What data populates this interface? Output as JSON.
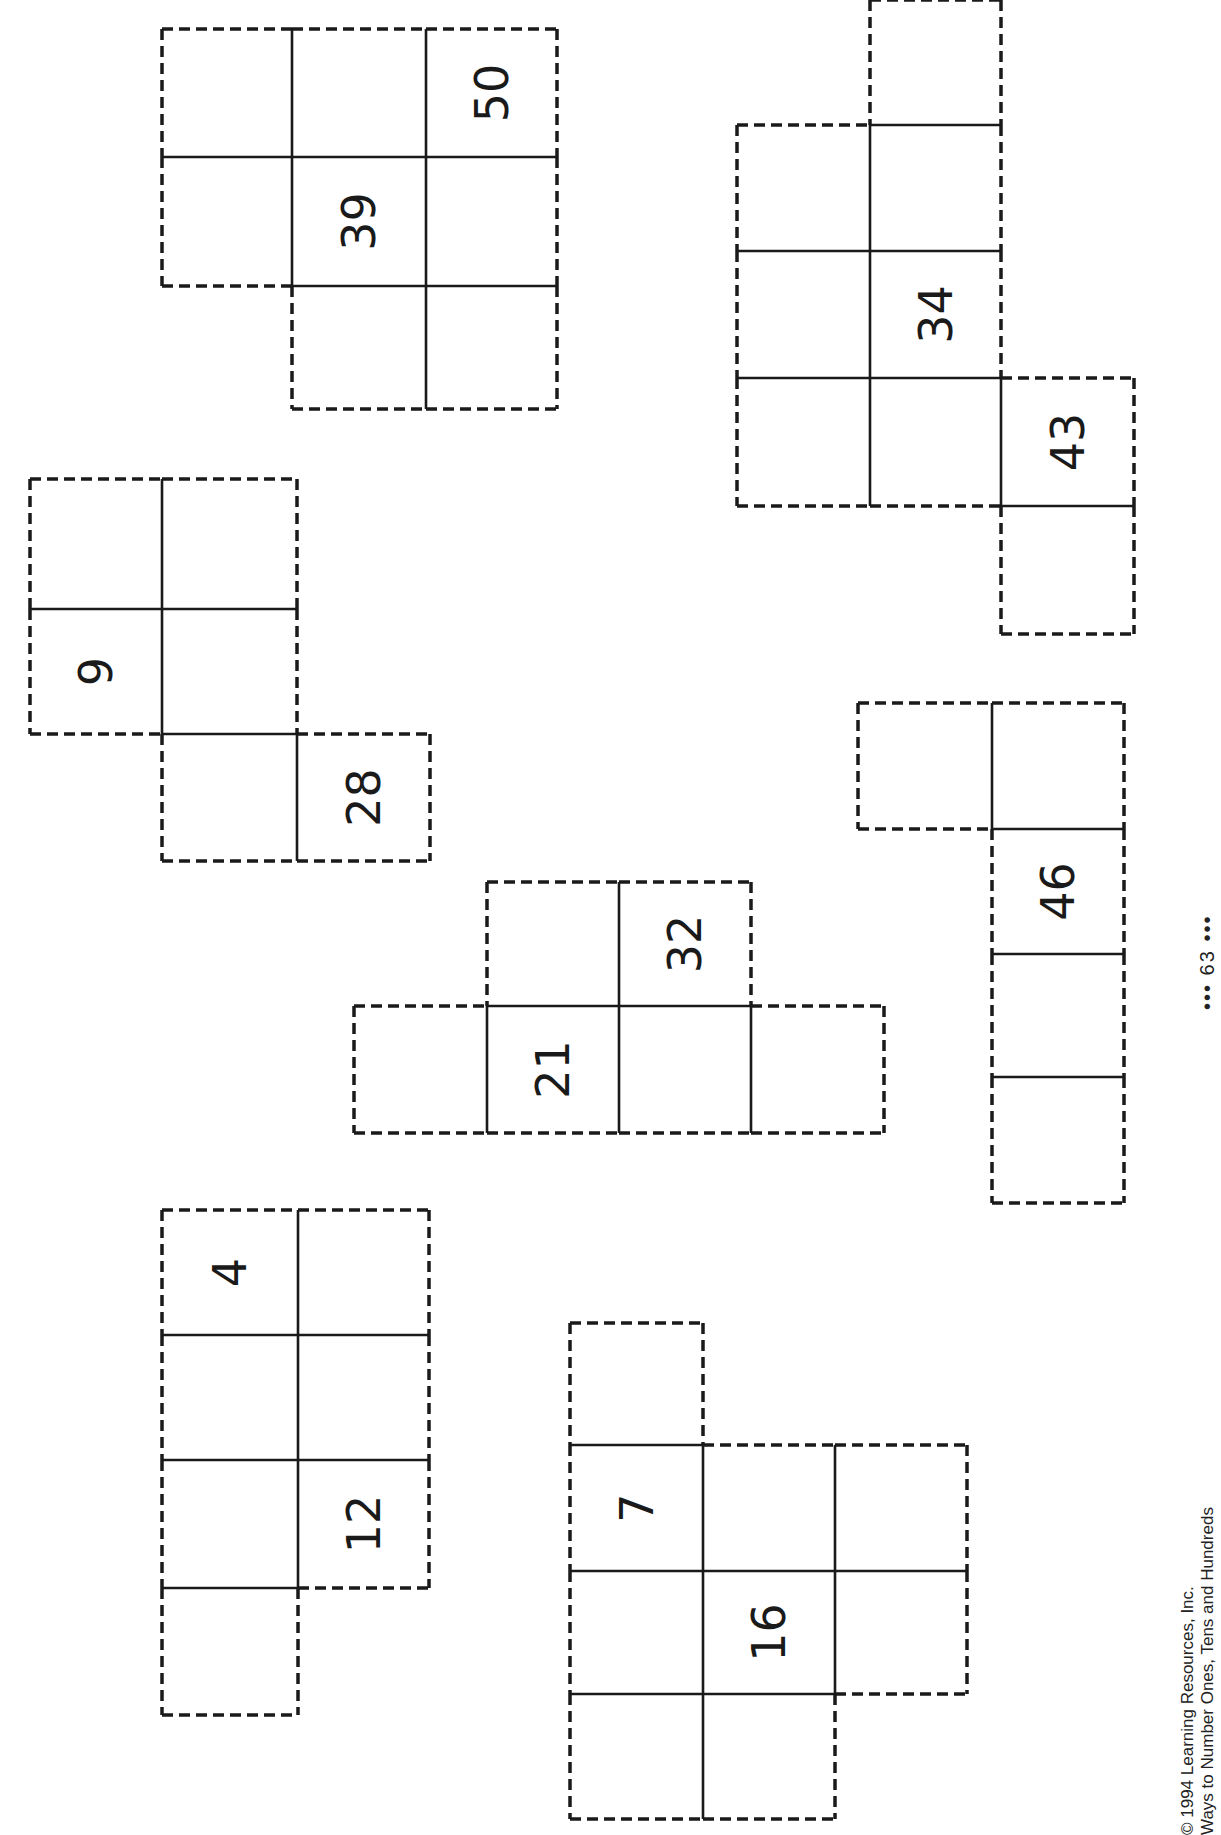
{
  "worksheet": {
    "page_number": "63",
    "page_number_decoration": "•••",
    "copyright": "© 1994 Learning Resources, Inc.",
    "book_title": "Ways to Number Ones, Tens and Hundreds",
    "line_color": "#1a1a1a",
    "background": "#ffffff"
  },
  "shapes": [
    {
      "id": "shape-39-50",
      "cols": [
        162,
        292,
        426,
        557
      ],
      "rows": [
        29,
        157,
        286,
        409
      ],
      "cells": [
        {
          "r": 0,
          "c": 0,
          "label": ""
        },
        {
          "r": 0,
          "c": 1,
          "label": ""
        },
        {
          "r": 0,
          "c": 2,
          "label": "50"
        },
        {
          "r": 1,
          "c": 0,
          "label": ""
        },
        {
          "r": 1,
          "c": 1,
          "label": "39"
        },
        {
          "r": 1,
          "c": 2,
          "label": ""
        },
        {
          "r": 2,
          "c": 1,
          "label": ""
        },
        {
          "r": 2,
          "c": 2,
          "label": ""
        }
      ]
    },
    {
      "id": "shape-9-28",
      "cols": [
        30,
        162,
        297,
        430
      ],
      "rows": [
        479,
        609,
        734,
        861
      ],
      "cells": [
        {
          "r": 0,
          "c": 0,
          "label": ""
        },
        {
          "r": 0,
          "c": 1,
          "label": ""
        },
        {
          "r": 1,
          "c": 0,
          "label": "9"
        },
        {
          "r": 1,
          "c": 1,
          "label": ""
        },
        {
          "r": 2,
          "c": 1,
          "label": ""
        },
        {
          "r": 2,
          "c": 2,
          "label": "28"
        }
      ]
    },
    {
      "id": "shape-34-43",
      "cols": [
        737,
        870,
        1001,
        1134
      ],
      "rows": [
        0,
        125,
        251,
        378,
        506,
        634
      ],
      "cells": [
        {
          "r": 0,
          "c": 1,
          "label": ""
        },
        {
          "r": 1,
          "c": 0,
          "label": ""
        },
        {
          "r": 1,
          "c": 1,
          "label": ""
        },
        {
          "r": 2,
          "c": 0,
          "label": ""
        },
        {
          "r": 2,
          "c": 1,
          "label": "34"
        },
        {
          "r": 3,
          "c": 0,
          "label": ""
        },
        {
          "r": 3,
          "c": 1,
          "label": ""
        },
        {
          "r": 3,
          "c": 2,
          "label": "43"
        },
        {
          "r": 4,
          "c": 2,
          "label": ""
        }
      ]
    },
    {
      "id": "shape-21-32",
      "cols": [
        354,
        487,
        619,
        751,
        884
      ],
      "rows": [
        882,
        1006,
        1133
      ],
      "cells": [
        {
          "r": 0,
          "c": 1,
          "label": ""
        },
        {
          "r": 0,
          "c": 2,
          "label": "32"
        },
        {
          "r": 1,
          "c": 0,
          "label": ""
        },
        {
          "r": 1,
          "c": 1,
          "label": "21"
        },
        {
          "r": 1,
          "c": 2,
          "label": ""
        },
        {
          "r": 1,
          "c": 3,
          "label": ""
        }
      ]
    },
    {
      "id": "shape-46",
      "cols": [
        858,
        992,
        1124
      ],
      "rows": [
        703,
        829,
        954,
        1077,
        1203
      ],
      "cells": [
        {
          "r": 0,
          "c": 0,
          "label": ""
        },
        {
          "r": 0,
          "c": 1,
          "label": ""
        },
        {
          "r": 1,
          "c": 1,
          "label": "46"
        },
        {
          "r": 2,
          "c": 1,
          "label": ""
        },
        {
          "r": 3,
          "c": 1,
          "label": ""
        }
      ]
    },
    {
      "id": "shape-4-12",
      "cols": [
        162,
        298,
        429
      ],
      "rows": [
        1210,
        1335,
        1460,
        1588,
        1715
      ],
      "cells": [
        {
          "r": 0,
          "c": 0,
          "label": "4"
        },
        {
          "r": 0,
          "c": 1,
          "label": ""
        },
        {
          "r": 1,
          "c": 0,
          "label": ""
        },
        {
          "r": 1,
          "c": 1,
          "label": ""
        },
        {
          "r": 2,
          "c": 0,
          "label": ""
        },
        {
          "r": 2,
          "c": 1,
          "label": "12"
        },
        {
          "r": 3,
          "c": 0,
          "label": ""
        }
      ]
    },
    {
      "id": "shape-7-16",
      "cols": [
        570,
        703,
        835,
        967
      ],
      "rows": [
        1323,
        1445,
        1571,
        1694,
        1819
      ],
      "cells": [
        {
          "r": 0,
          "c": 0,
          "label": ""
        },
        {
          "r": 1,
          "c": 0,
          "label": "7"
        },
        {
          "r": 1,
          "c": 1,
          "label": ""
        },
        {
          "r": 1,
          "c": 2,
          "label": ""
        },
        {
          "r": 2,
          "c": 0,
          "label": ""
        },
        {
          "r": 2,
          "c": 1,
          "label": "16"
        },
        {
          "r": 2,
          "c": 2,
          "label": ""
        },
        {
          "r": 3,
          "c": 0,
          "label": ""
        },
        {
          "r": 3,
          "c": 1,
          "label": ""
        }
      ]
    }
  ]
}
